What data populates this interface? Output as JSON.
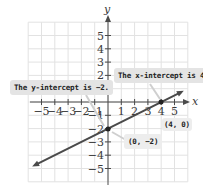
{
  "chart_data": {
    "type": "line",
    "title": "",
    "xlabel": "x",
    "ylabel": "y",
    "xlim": [
      -6,
      6
    ],
    "ylim": [
      -6,
      6
    ],
    "grid": true,
    "x_ticks": [
      "−5",
      "−4",
      "−3",
      "−2",
      "−1",
      "1",
      "2",
      "3",
      "4",
      "5"
    ],
    "y_ticks": [
      "5",
      "4",
      "3",
      "2",
      "1",
      "−1",
      "−2",
      "−3",
      "−4",
      "−5"
    ],
    "series": [
      {
        "name": "line",
        "equation": "y = 0.5x - 2",
        "x": [
          -5.5,
          5.5
        ],
        "y": [
          -4.75,
          0.75
        ],
        "color": "#4a4a4a"
      }
    ],
    "points": [
      {
        "x": 0,
        "y": -2,
        "label": "(0, −2)"
      },
      {
        "x": 4,
        "y": 0,
        "label": "(4, 0)"
      }
    ],
    "annotations": [
      {
        "text": "The y-intercept is −2.",
        "points_to": [
          0,
          -2
        ]
      },
      {
        "text": "The x-intercept is 4.",
        "points_to": [
          4,
          0
        ]
      }
    ]
  },
  "labels": {
    "x_axis": "x",
    "y_axis": "y",
    "y_intercept_callout": "The y-intercept is −2.",
    "x_intercept_callout": "The x-intercept is 4.",
    "point_y_intercept": "(0, −2)",
    "point_x_intercept": "(4, 0)"
  },
  "colors": {
    "grid": "#e2e2e2",
    "axis": "#4a4a4a",
    "line": "#4a4a4a",
    "callout_bg": "#e4e4e4"
  }
}
